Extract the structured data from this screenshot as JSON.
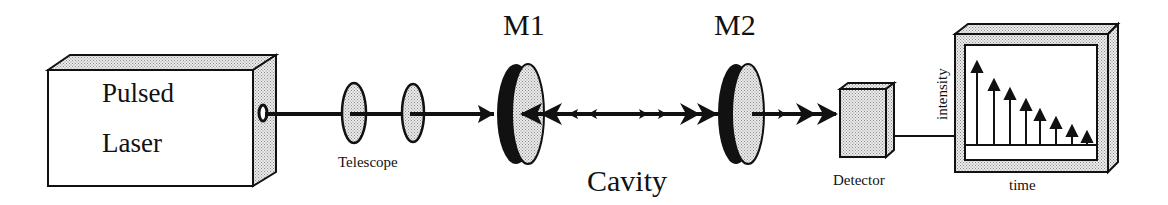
{
  "diagram": {
    "components": {
      "laser": {
        "label_line1": "Pulsed",
        "label_line2": "Laser"
      },
      "telescope": {
        "label": "Telescope",
        "lens_count": 2
      },
      "mirror1": {
        "label": "M1"
      },
      "mirror2": {
        "label": "M2"
      },
      "cavity": {
        "label": "Cavity"
      },
      "detector": {
        "label": "Detector"
      },
      "oscilloscope": {
        "y_axis_label": "intensity",
        "x_axis_label": "time",
        "pulse_heights": [
          1.0,
          0.8,
          0.7,
          0.58,
          0.48,
          0.38,
          0.27,
          0.19
        ]
      }
    },
    "colors": {
      "ink": "#111111",
      "fill_stipple": "#d9d9d9",
      "background": "#ffffff"
    }
  }
}
